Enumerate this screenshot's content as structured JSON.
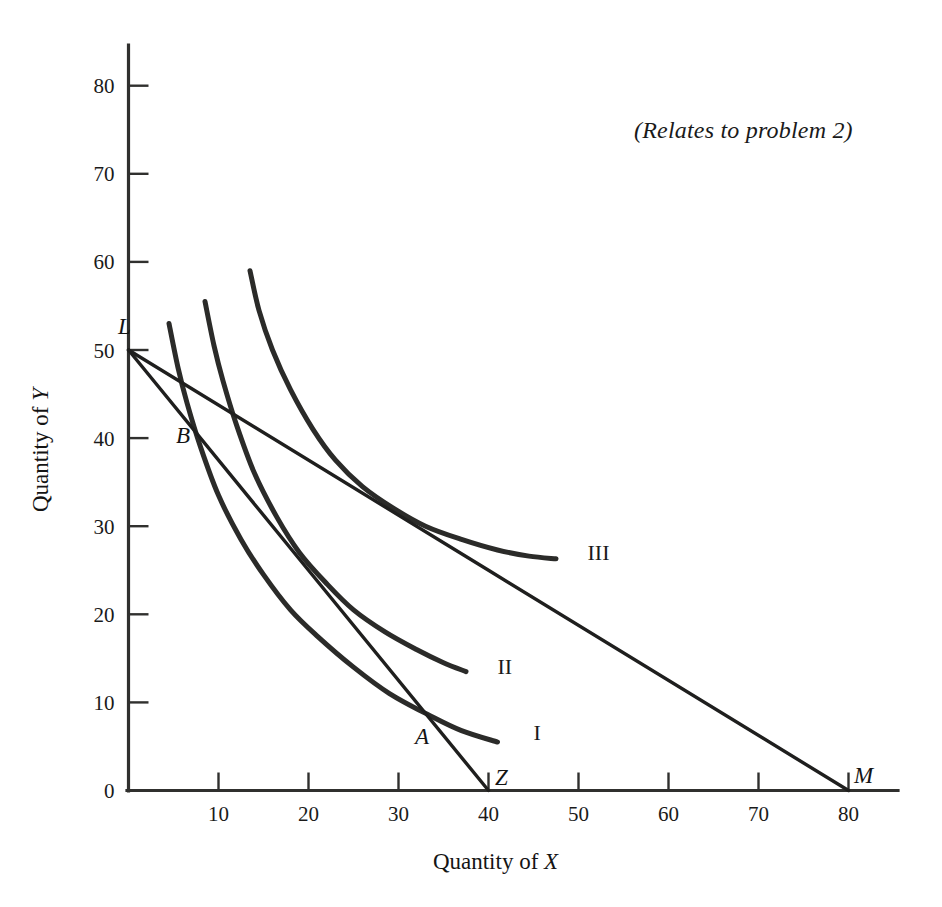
{
  "figure": {
    "note": "(Relates to problem 2)",
    "background_color": "#ffffff",
    "ink_color": "#2b2b29"
  },
  "chart_data": {
    "type": "line",
    "title": "",
    "subtitle": "",
    "annotation": "(Relates to problem 2)",
    "xlabel_prefix": "Quantity of ",
    "xlabel_var": "X",
    "ylabel_prefix": "Quantity of ",
    "ylabel_var": "Y",
    "xlim": [
      0,
      85
    ],
    "ylim": [
      0,
      85
    ],
    "grid": false,
    "legend_position": "inline-curve-end",
    "xticks": [
      0,
      10,
      20,
      30,
      40,
      50,
      60,
      70,
      80
    ],
    "xtick_labels": [
      "0",
      "10",
      "20",
      "30",
      "40",
      "50",
      "60",
      "70",
      "80"
    ],
    "yticks": [
      0,
      10,
      20,
      30,
      40,
      50,
      60,
      70,
      80
    ],
    "ytick_labels": [
      "0",
      "10",
      "20",
      "30",
      "40",
      "50",
      "60",
      "70",
      "80"
    ],
    "series": [
      {
        "name": "I",
        "kind": "indifference-curve",
        "label": "I",
        "label_at": [
          45.0,
          6.5
        ],
        "x": [
          4.5,
          5.5,
          6.5,
          8.0,
          10.0,
          12.5,
          15.0,
          18.0,
          21.0,
          25.0,
          29.0,
          33.5,
          37.0,
          41.0
        ],
        "y": [
          53.0,
          48.0,
          44.0,
          39.0,
          33.5,
          28.5,
          24.5,
          20.5,
          17.5,
          14.0,
          11.0,
          8.5,
          6.8,
          5.5
        ]
      },
      {
        "name": "II",
        "kind": "indifference-curve",
        "label": "II",
        "label_at": [
          41.0,
          14.0
        ],
        "x": [
          8.5,
          9.5,
          10.5,
          12.0,
          14.0,
          16.5,
          19.0,
          22.0,
          25.0,
          28.5,
          32.0,
          35.0,
          37.5
        ],
        "y": [
          55.5,
          50.5,
          46.5,
          41.5,
          36.0,
          31.0,
          27.0,
          23.5,
          20.5,
          18.0,
          16.0,
          14.5,
          13.5
        ]
      },
      {
        "name": "III",
        "kind": "indifference-curve",
        "label": "III",
        "label_at": [
          51.0,
          27.0
        ],
        "x": [
          13.5,
          14.5,
          16.0,
          18.0,
          20.5,
          23.0,
          26.0,
          29.5,
          33.0,
          37.0,
          41.0,
          44.5,
          47.5
        ],
        "y": [
          59.0,
          54.5,
          50.0,
          45.5,
          41.0,
          37.5,
          34.5,
          32.0,
          30.0,
          28.5,
          27.3,
          26.6,
          26.3
        ]
      },
      {
        "name": "LZ",
        "kind": "budget-line",
        "label": "",
        "x": [
          0,
          40
        ],
        "y": [
          50,
          0
        ]
      },
      {
        "name": "LM",
        "kind": "budget-line",
        "label": "",
        "x": [
          0,
          80
        ],
        "y": [
          50,
          0
        ]
      }
    ],
    "annotated_points": [
      {
        "label": "L",
        "x": 0.0,
        "y": 50.0,
        "desc": "common vertical intercept of both budget lines"
      },
      {
        "label": "B",
        "x": 8.5,
        "y": 41.0,
        "desc": "tangency of line LZ with curve I"
      },
      {
        "label": "A",
        "x": 33.5,
        "y": 8.5,
        "desc": "crossing of line LZ and curve I"
      },
      {
        "label": "Z",
        "x": 40.0,
        "y": 0.0,
        "desc": "horizontal intercept of steeper budget line"
      },
      {
        "label": "M",
        "x": 80.0,
        "y": 0.0,
        "desc": "horizontal intercept of flatter budget line"
      }
    ]
  }
}
